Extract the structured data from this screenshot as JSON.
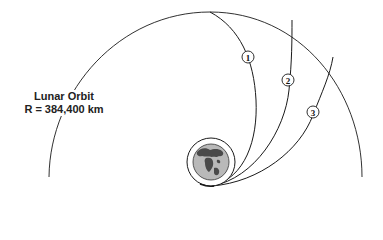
{
  "diagram": {
    "lunar_orbit": {
      "label": "Lunar Orbit",
      "radius_label": "R = 384,400 km"
    },
    "earth": {
      "name": "Earth",
      "parking_orbit": "Parking orbit ring"
    },
    "trajectories": [
      {
        "id": "1",
        "label": "1"
      },
      {
        "id": "2",
        "label": "2"
      },
      {
        "id": "3",
        "label": "3"
      }
    ],
    "colors": {
      "line": "#1a1a1a",
      "earth_fill": "#b9b9b9",
      "land": "#4a4a4a",
      "background": "#ffffff"
    }
  }
}
